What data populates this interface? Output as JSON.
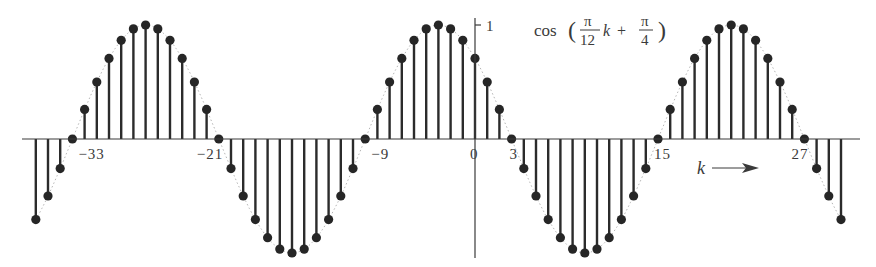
{
  "chart_data": {
    "type": "stem",
    "formula": {
      "prefix": "cos",
      "open_paren": "(",
      "frac1_num": "π",
      "frac1_den": "12",
      "variable": "k",
      "plus": "+",
      "frac2_num": "π",
      "frac2_den": "4",
      "close_paren": ")"
    },
    "xlabel": "k",
    "ylabel": "",
    "y_tick_label": "1",
    "x_tick_labels": [
      {
        "k": -33,
        "text": "−33"
      },
      {
        "k": -21,
        "text": "−21"
      },
      {
        "k": -9,
        "text": "−9"
      },
      {
        "k": 0,
        "text": "0"
      },
      {
        "k": 3,
        "text": "3"
      },
      {
        "k": 15,
        "text": "15"
      },
      {
        "k": 27,
        "text": "27"
      }
    ],
    "xlim": [
      -36,
      30
    ],
    "ylim": [
      -1,
      1
    ],
    "grid": false,
    "legend": "none",
    "x": [
      -36,
      -35,
      -34,
      -33,
      -32,
      -31,
      -30,
      -29,
      -28,
      -27,
      -26,
      -25,
      -24,
      -23,
      -22,
      -21,
      -20,
      -19,
      -18,
      -17,
      -16,
      -15,
      -14,
      -13,
      -12,
      -11,
      -10,
      -9,
      -8,
      -7,
      -6,
      -5,
      -4,
      -3,
      -2,
      -1,
      0,
      1,
      2,
      3,
      4,
      5,
      6,
      7,
      8,
      9,
      10,
      11,
      12,
      13,
      14,
      15,
      16,
      17,
      18,
      19,
      20,
      21,
      22,
      23,
      24,
      25,
      26,
      27,
      28,
      29,
      30
    ],
    "values": [
      -0.707,
      -0.5,
      -0.259,
      0,
      0.259,
      0.5,
      0.707,
      0.866,
      0.966,
      1,
      0.966,
      0.866,
      0.707,
      0.5,
      0.259,
      0,
      -0.259,
      -0.5,
      -0.707,
      -0.866,
      -0.966,
      -1,
      -0.966,
      -0.866,
      -0.707,
      -0.5,
      -0.259,
      0,
      0.259,
      0.5,
      0.707,
      0.866,
      0.966,
      1,
      0.966,
      0.866,
      0.707,
      0.5,
      0.259,
      0,
      -0.259,
      -0.5,
      -0.707,
      -0.866,
      -0.966,
      -1,
      -0.966,
      -0.866,
      -0.707,
      -0.5,
      -0.259,
      0,
      0.259,
      0.5,
      0.707,
      0.866,
      0.966,
      1,
      0.966,
      0.866,
      0.707,
      0.5,
      0.259,
      0,
      -0.259,
      -0.5,
      -0.707
    ]
  },
  "colors": {
    "stem": "#2b2b2b",
    "dot": "#262626",
    "axis": "#3a3a3a",
    "envelope": "#b5b5b5",
    "text": "#3a3a3a"
  }
}
